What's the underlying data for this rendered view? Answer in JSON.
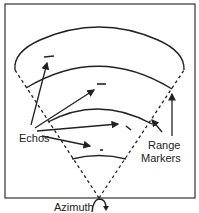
{
  "diagram": {
    "labels": {
      "echos": "Echos",
      "range_markers_line1": "Range",
      "range_markers_line2": "Markers",
      "azimuth": "Azimuth"
    },
    "colors": {
      "ink": "#222222",
      "background": "#ffffff"
    }
  }
}
